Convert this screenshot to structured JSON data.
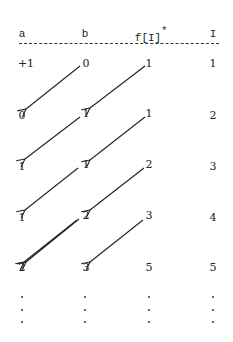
{
  "header": {
    "columns": [
      "a",
      "b",
      "f[I]",
      "I"
    ],
    "asterisk": "*"
  },
  "rows": [
    {
      "a": "+1",
      "b": "0",
      "f": "1",
      "i": "1"
    },
    {
      "a": "0",
      "b": "1",
      "f": "1",
      "i": "2"
    },
    {
      "a": "1",
      "b": "1",
      "f": "2",
      "i": "3"
    },
    {
      "a": "1",
      "b": "2",
      "f": "3",
      "i": "4"
    },
    {
      "a": "2",
      "b": "3",
      "f": "5",
      "i": "5"
    }
  ],
  "continuation": "⋮",
  "arrows": [
    {
      "from": "row0.b",
      "to": "row1.a"
    },
    {
      "from": "row0.f",
      "to": "row1.b"
    },
    {
      "from": "row1.b",
      "to": "row2.a"
    },
    {
      "from": "row1.f",
      "to": "row2.b"
    },
    {
      "from": "row2.b",
      "to": "row3.a"
    },
    {
      "from": "row2.f",
      "to": "row3.b"
    },
    {
      "from": "row3.b",
      "to": "row4.a"
    },
    {
      "from": "row3.f",
      "to": "row4.b"
    }
  ]
}
